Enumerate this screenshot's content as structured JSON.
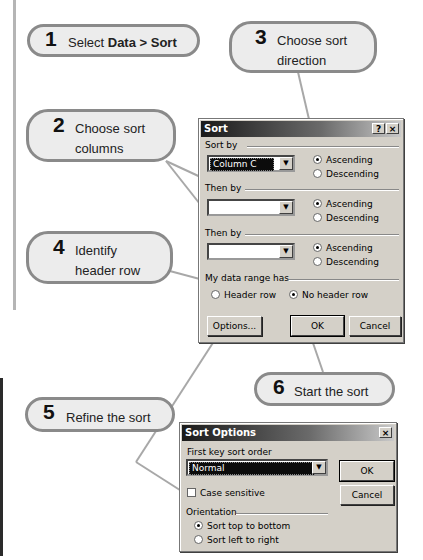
{
  "callouts": [
    {
      "num": "1",
      "text_plain": "Select ",
      "text_bold": "Data > Sort"
    },
    {
      "num": "2",
      "line1": "Choose sort",
      "line2": "columns"
    },
    {
      "num": "3",
      "line1": "Choose sort",
      "line2": "direction"
    },
    {
      "num": "4",
      "line1": "Identify",
      "line2": "header row"
    },
    {
      "num": "5",
      "text": "Refine the sort"
    },
    {
      "num": "6",
      "text": "Start the sort"
    }
  ],
  "sort_dialog": {
    "title": "Sort",
    "help_icon": "?",
    "close_icon": "×",
    "sort_by": {
      "label": "Sort by",
      "value": "Column C",
      "ascending": "Ascending",
      "descending": "Descending",
      "selected": "Ascending"
    },
    "then_by_1": {
      "label": "Then by",
      "value": "",
      "ascending": "Ascending",
      "descending": "Descending",
      "selected": "Ascending"
    },
    "then_by_2": {
      "label": "Then by",
      "value": "",
      "ascending": "Ascending",
      "descending": "Descending",
      "selected": "Ascending"
    },
    "header": {
      "label": "My data range has",
      "header_row": "Header row",
      "no_header_row": "No header row",
      "selected": "No header row"
    },
    "buttons": {
      "options": "Options...",
      "ok": "OK",
      "cancel": "Cancel"
    }
  },
  "sort_options_dialog": {
    "title": "Sort Options",
    "close_icon": "×",
    "first_key_label": "First key sort order",
    "first_key_value": "Normal",
    "case_sensitive": "Case sensitive",
    "case_sensitive_checked": false,
    "orientation_label": "Orientation",
    "top_to_bottom": "Sort top to bottom",
    "left_to_right": "Sort left to right",
    "orientation_selected": "Sort top to bottom",
    "buttons": {
      "ok": "OK",
      "cancel": "Cancel"
    }
  }
}
